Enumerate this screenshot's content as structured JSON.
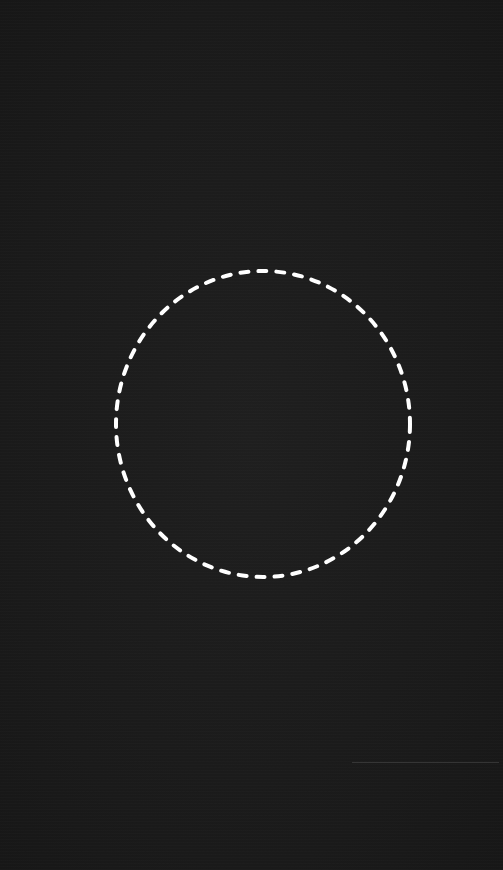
{
  "screen": {
    "type": "camera-capture-view",
    "background_color": "#1b1b1b"
  },
  "face_guide": {
    "shape": "dashed-oval",
    "stroke_color": "#ffffff",
    "stroke_width": 4,
    "dash_length": 8,
    "gap_length": 10,
    "center_x": 263,
    "center_y": 424,
    "radius_x": 147,
    "radius_y": 153
  }
}
